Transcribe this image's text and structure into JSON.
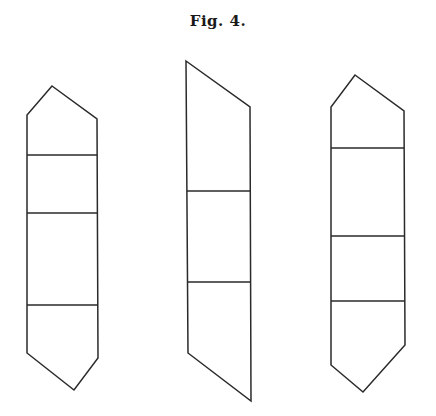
{
  "figure": {
    "title": "Fig. 4.",
    "stroke_color": "#2a2a2a",
    "background": "#ffffff"
  },
  "crystals": [
    {
      "name": "left",
      "outline": "52,86 97,119 98,358 74,390 27,353 27,115",
      "dividers": [
        {
          "x1": 27,
          "y1": 155,
          "x2": 97,
          "y2": 155
        },
        {
          "x1": 27,
          "y1": 213,
          "x2": 97,
          "y2": 213
        },
        {
          "x1": 27,
          "y1": 305,
          "x2": 98,
          "y2": 305
        }
      ]
    },
    {
      "name": "middle",
      "outline": "186,61 250,107 251,401 188,353",
      "dividers": [
        {
          "x1": 187,
          "y1": 191,
          "x2": 250,
          "y2": 191
        },
        {
          "x1": 188,
          "y1": 282,
          "x2": 251,
          "y2": 282
        }
      ]
    },
    {
      "name": "right",
      "outline": "355,75 404,111 405,345 363,392 331,365 331,107",
      "dividers": [
        {
          "x1": 331,
          "y1": 148,
          "x2": 404,
          "y2": 148
        },
        {
          "x1": 331,
          "y1": 236,
          "x2": 404,
          "y2": 236
        },
        {
          "x1": 331,
          "y1": 301,
          "x2": 405,
          "y2": 301
        }
      ]
    }
  ]
}
